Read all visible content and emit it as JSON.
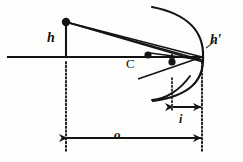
{
  "figure": {
    "stroke_color": "#141414",
    "background": "#fdfdfb",
    "width": 243,
    "height": 162
  },
  "labels": {
    "object_height": "h",
    "image_height": "h′",
    "center_of_curvature": "C",
    "object_distance": "o",
    "image_distance": "i"
  },
  "geometry": {
    "axis": {
      "x1": 8,
      "y1": 57,
      "x2": 203,
      "y2": 57
    },
    "object_point": {
      "x": 66,
      "y": 22
    },
    "object_stem": {
      "x": 66,
      "y1": 22,
      "y2": 57
    },
    "vertex": {
      "x": 202,
      "y": 57
    },
    "center_point": {
      "x": 148,
      "y": 55
    },
    "image_point": {
      "x": 172,
      "y": 62
    },
    "mirror_arc": "M 152 7 C 188 14 204 32 203 57 C 204 82 188 96 153 101",
    "mirror_arc_lower": "M 152 100 C 166 99 180 90 190 76",
    "rays": [
      {
        "name": "ray-upper-incident",
        "x1": 66,
        "y1": 22,
        "x2": 202,
        "y2": 57
      },
      {
        "name": "ray-through-center-incident",
        "x1": 66,
        "y1": 22,
        "x2": 202,
        "y2": 60
      },
      {
        "name": "ray-reflected-lower",
        "x1": 202,
        "y1": 57,
        "x2": 138,
        "y2": 79
      },
      {
        "name": "ray-reflected-upper",
        "x1": 203,
        "y1": 60,
        "x2": 150,
        "y2": 53
      },
      {
        "name": "ray-chief",
        "x1": 66,
        "y1": 22,
        "x2": 203,
        "y2": 62
      }
    ],
    "image_arrow": {
      "x": 172,
      "y1": 54,
      "y2": 64
    },
    "leader_line": "M 206 48 C 212 44 214 42 214 40",
    "dotted_lines": [
      {
        "name": "dotted-object-plane",
        "x": 66,
        "y1": 62,
        "y2": 151
      },
      {
        "name": "dotted-image-plane",
        "x": 172,
        "y1": 78,
        "y2": 112
      },
      {
        "name": "dotted-mirror-plane",
        "x": 202,
        "y1": 62,
        "y2": 151
      }
    ],
    "measure_i": {
      "x1": 173,
      "x2": 201,
      "y": 107
    },
    "measure_o": {
      "x1": 67,
      "x2": 201,
      "y": 138
    }
  },
  "label_positions": {
    "h": {
      "x": 47,
      "y": 31
    },
    "h_prime": {
      "x": 210,
      "y": 33
    },
    "C": {
      "x": 126,
      "y": 57
    },
    "o": {
      "x": 114,
      "y": 128
    },
    "i": {
      "x": 179,
      "y": 113
    }
  }
}
